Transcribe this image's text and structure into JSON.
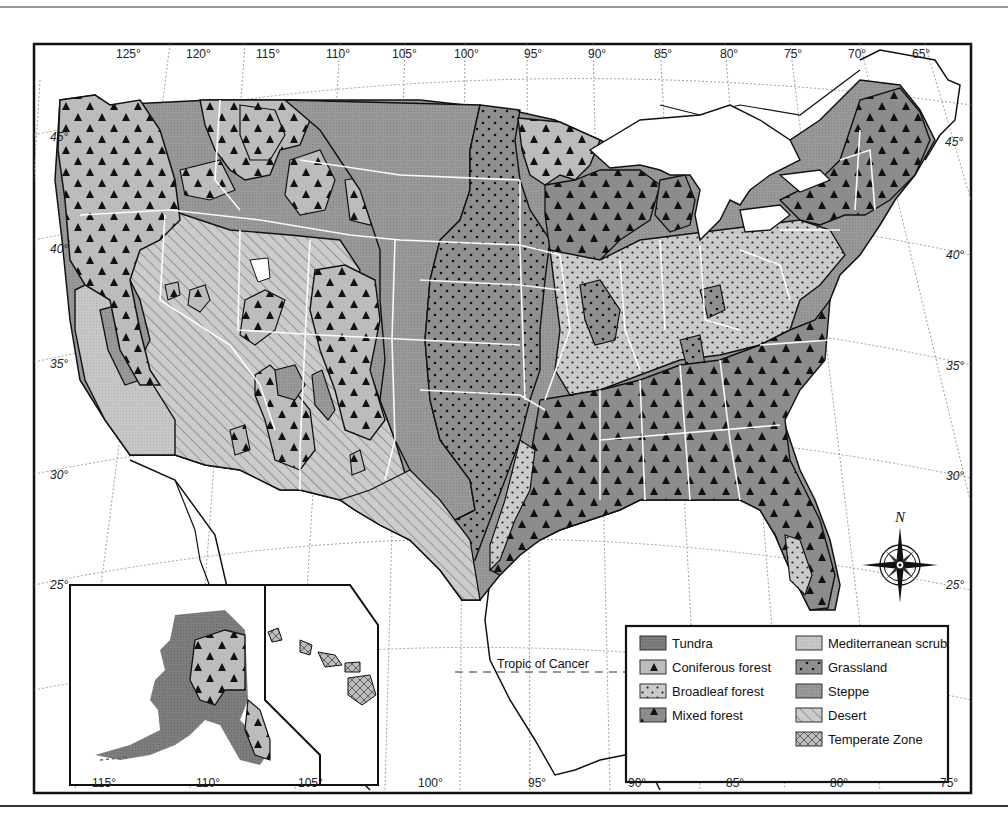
{
  "map": {
    "title": "Natural vegetation regions of the United States",
    "longitude_ticks_top": [
      "125°",
      "120°",
      "115°",
      "110°",
      "105°",
      "100°",
      "95°",
      "90°",
      "85°",
      "80°",
      "75°",
      "70°",
      "65°"
    ],
    "longitude_ticks_bottom": [
      "115°",
      "110°",
      "105°",
      "100°",
      "95°",
      "90°",
      "85°",
      "80°",
      "75°"
    ],
    "latitude_ticks_left": [
      "45°",
      "40°",
      "35°",
      "30°",
      "25°"
    ],
    "latitude_ticks_right": [
      "45°",
      "40°",
      "35°",
      "30°",
      "25°"
    ],
    "tropic_label": "Tropic of Cancer",
    "north_label": "N",
    "compass": "compass-rose-icon",
    "insets": [
      "Alaska",
      "Hawaii"
    ]
  },
  "legend": {
    "left_column": [
      {
        "label": "Tundra",
        "pattern": "tundra"
      },
      {
        "label": "Coniferous forest",
        "pattern": "coniferous"
      },
      {
        "label": "Broadleaf forest",
        "pattern": "broadleaf"
      },
      {
        "label": "Mixed forest",
        "pattern": "mixed"
      }
    ],
    "right_column": [
      {
        "label": "Mediterranean scrub",
        "pattern": "mediterranean"
      },
      {
        "label": "Grassland",
        "pattern": "grassland"
      },
      {
        "label": "Steppe",
        "pattern": "steppe"
      },
      {
        "label": "Desert",
        "pattern": "desert"
      },
      {
        "label": "Temperate Zone",
        "pattern": "temperate"
      }
    ]
  },
  "colors": {
    "tundra": "#7a7a7a",
    "coniferous": "#b9b9b9",
    "broadleaf": "#c9c9c9",
    "mixed": "#8c8c8c",
    "mediterranean": "#c4c4c4",
    "grassland": "#8e8e8e",
    "steppe": "#959595",
    "desert": "#c8c8c8",
    "temperate": "#bcbcbc",
    "border": "#111111",
    "state_line": "#ffffff"
  }
}
